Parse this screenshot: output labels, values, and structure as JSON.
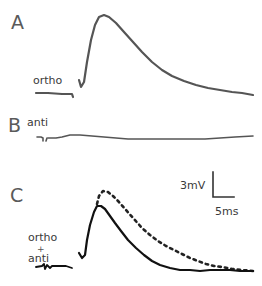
{
  "panels": [
    {
      "id": "A",
      "label": "A",
      "condition": "ortho"
    },
    {
      "id": "B",
      "label": "B",
      "condition": "anti"
    },
    {
      "id": "C",
      "label": "C",
      "condition_lines": [
        "ortho",
        "+",
        "anti"
      ]
    }
  ],
  "scale_bar": {
    "vertical_label": "3mV",
    "horizontal_label": "5ms"
  },
  "colors": {
    "trace_a": "#555555",
    "trace_b": "#555555",
    "trace_c_solid": "#111111",
    "trace_c_dashed": "#222222"
  }
}
